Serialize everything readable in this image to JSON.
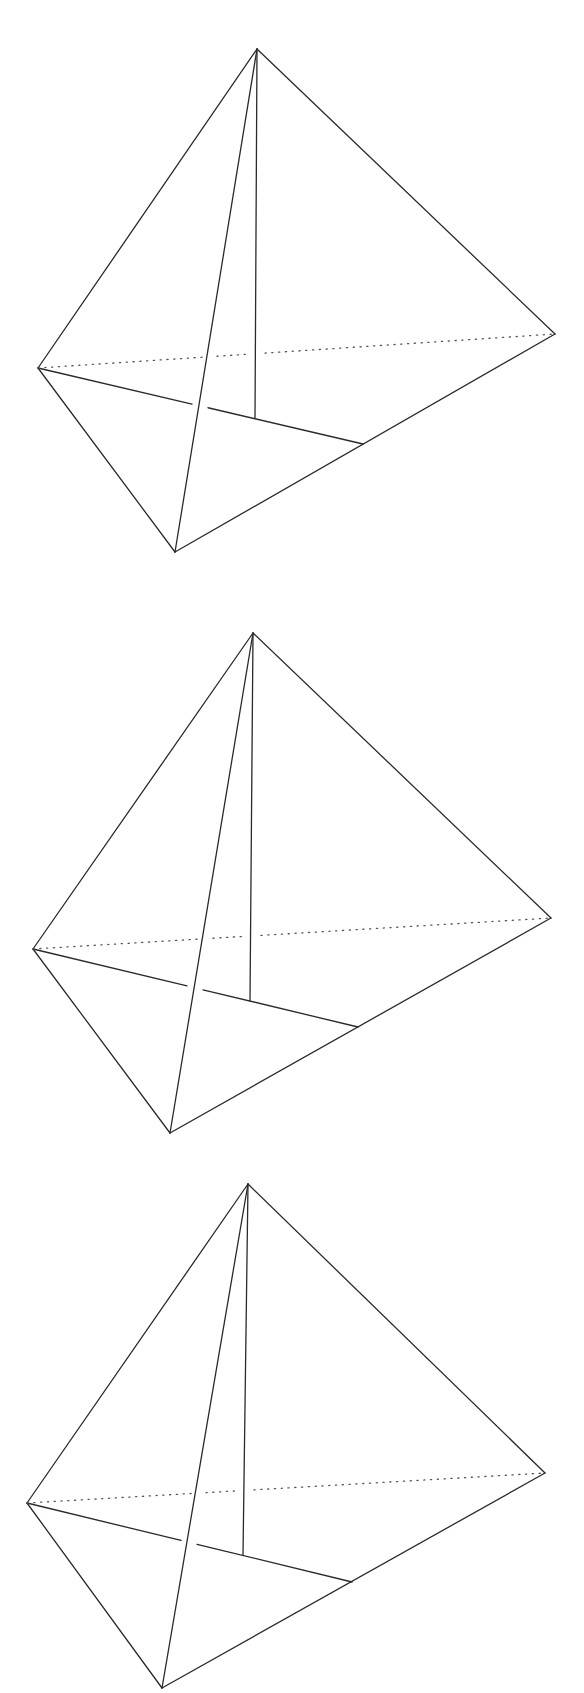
{
  "figure": {
    "colors": {
      "background": "#ffffff",
      "stroke": "#2a2a2a",
      "hidden_stroke": "#555555"
    },
    "tetrahedra": [
      {
        "id": "tetrahedron-1",
        "vertices": {
          "apex": [
            257,
            49
          ],
          "left": [
            38,
            368
          ],
          "right": [
            555,
            334
          ],
          "bottom": [
            175,
            552
          ]
        },
        "altitude_foot": [
          255,
          418
        ],
        "median_end": [
          363,
          444
        ],
        "median_gap": [
          [
            192,
            405
          ],
          [
            208,
            409
          ]
        ],
        "hidden_edge_gaps": [
          [
            203,
            217
          ],
          [
            250,
            265
          ]
        ]
      },
      {
        "id": "tetrahedron-2",
        "vertices": {
          "apex": [
            253,
            633
          ],
          "left": [
            33,
            949
          ],
          "right": [
            551,
            918
          ],
          "bottom": [
            170,
            1133
          ]
        },
        "altitude_foot": [
          250,
          1001
        ],
        "median_end": [
          358,
          1027
        ],
        "median_gap": [
          [
            187,
            987
          ],
          [
            203,
            991
          ]
        ],
        "hidden_edge_gaps": [
          [
            198,
            213
          ],
          [
            243,
            261
          ]
        ]
      },
      {
        "id": "tetrahedron-3",
        "vertices": {
          "apex": [
            248,
            1184
          ],
          "left": [
            27,
            1503
          ],
          "right": [
            545,
            1473
          ],
          "bottom": [
            162,
            1688
          ]
        },
        "altitude_foot": [
          243,
          1555
        ],
        "median_end": [
          352,
          1582
        ],
        "median_gap": [
          [
            181,
            1540
          ],
          [
            197,
            1544
          ]
        ],
        "hidden_edge_gaps": [
          [
            192,
            206
          ],
          [
            239,
            254
          ]
        ]
      }
    ]
  }
}
